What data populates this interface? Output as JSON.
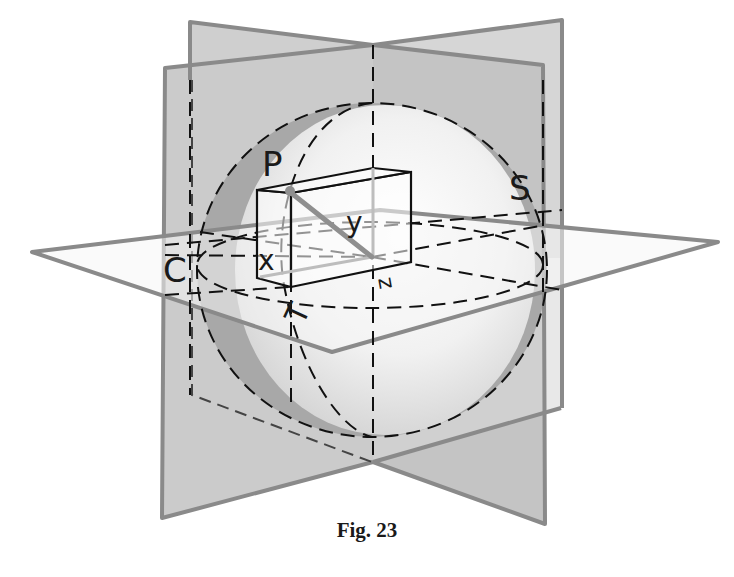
{
  "figure": {
    "caption": "Fig. 23",
    "labels": {
      "P": "P",
      "S": "S",
      "C": "C",
      "T": "T",
      "x": "x",
      "y": "y",
      "z": "z"
    },
    "elements": [
      "sphere",
      "vertical plane (left, receding)",
      "vertical plane (right, receding)",
      "horizontal plane T",
      "equatorial circle C",
      "meridian circle S",
      "rectangular box with coordinates x, y, z",
      "radius vector to point P"
    ],
    "colors": {
      "plane_fill": "#c9c9c9",
      "plane_edge": "#8a8a8a",
      "sphere_ring": "#a9a9a9",
      "line": "#111111"
    }
  }
}
